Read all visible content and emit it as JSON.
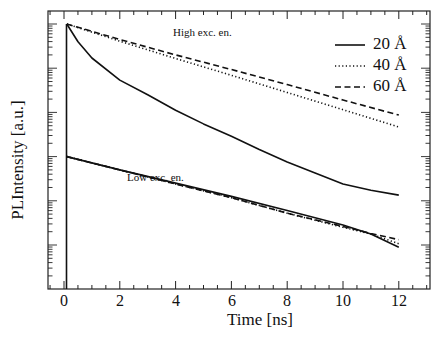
{
  "chart_data": {
    "type": "line",
    "title": "",
    "xlabel": "Time [ns]",
    "ylabel": "PLIntensity [a.u.]",
    "xlim": [
      -0.6,
      13.1
    ],
    "xticks": [
      0,
      2,
      4,
      6,
      8,
      10,
      12
    ],
    "yscale": "log",
    "ylim_decades_relative": [
      -6.0,
      0.3
    ],
    "y_tick_labels": [],
    "grid": false,
    "legend_position": "upper right",
    "legend": [
      "20 Å",
      "40 Å",
      "60 Å"
    ],
    "annotations": [
      "High exc. en.",
      "Low exc. en."
    ],
    "note": "y values are log10(intensity) relative to the initial high-excitation peak (decades)",
    "series": [
      {
        "name": "20 Å",
        "group": "High exc. en.",
        "style": "solid",
        "x": [
          0.1,
          0.5,
          1,
          2,
          3,
          4,
          5,
          6,
          7,
          8,
          9,
          10,
          11,
          12
        ],
        "y": [
          0.0,
          -0.4,
          -0.77,
          -1.27,
          -1.6,
          -1.95,
          -2.26,
          -2.54,
          -2.84,
          -3.12,
          -3.37,
          -3.62,
          -3.76,
          -3.87
        ]
      },
      {
        "name": "40 Å",
        "group": "High exc. en.",
        "style": "dotted",
        "x": [
          0.1,
          2,
          4,
          6,
          8,
          10,
          12
        ],
        "y": [
          0.0,
          -0.39,
          -0.78,
          -1.16,
          -1.55,
          -1.94,
          -2.33
        ]
      },
      {
        "name": "60 Å",
        "group": "High exc. en.",
        "style": "dashed",
        "x": [
          0.1,
          2,
          4,
          6,
          8,
          10,
          12
        ],
        "y": [
          0.0,
          -0.35,
          -0.7,
          -1.03,
          -1.37,
          -1.72,
          -2.06
        ]
      },
      {
        "name": "20 Å",
        "group": "Low exc. en.",
        "style": "solid",
        "x": [
          0.1,
          2,
          4,
          6,
          8,
          10,
          11,
          12
        ],
        "y": [
          -3.0,
          -3.3,
          -3.6,
          -3.9,
          -4.22,
          -4.55,
          -4.75,
          -5.05
        ]
      },
      {
        "name": "40 Å",
        "group": "Low exc. en.",
        "style": "dotted",
        "x": [
          0.1,
          2,
          4,
          6,
          8,
          10,
          11,
          12
        ],
        "y": [
          -3.0,
          -3.3,
          -3.62,
          -3.93,
          -4.28,
          -4.6,
          -4.75,
          -4.97
        ]
      },
      {
        "name": "60 Å",
        "group": "Low exc. en.",
        "style": "dashed",
        "x": [
          0.1,
          2,
          4,
          6,
          8,
          10,
          11,
          12
        ],
        "y": [
          -3.0,
          -3.3,
          -3.62,
          -3.93,
          -4.28,
          -4.58,
          -4.74,
          -4.88
        ]
      }
    ]
  },
  "labels": {
    "xlabel": "Time [ns]",
    "ylabel": "PLIntensity [a.u.]",
    "xticks": [
      "0",
      "2",
      "4",
      "6",
      "8",
      "10",
      "12"
    ],
    "annot_high": "High exc. en.",
    "annot_low": "Low exc. en.",
    "legend": [
      "20 Å",
      "40 Å",
      "60 Å"
    ]
  }
}
